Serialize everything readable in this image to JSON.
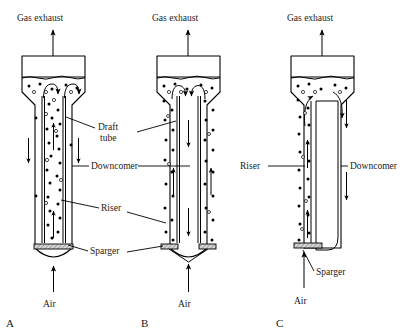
{
  "figure": {
    "panels": [
      {
        "id": "A",
        "letter": "A",
        "type": "internal-loop-draft-tube-riser",
        "gas_outlet_label": "Gas exhaust",
        "air_inlet_label": "Air",
        "riser_location": "inner draft tube (upflow)",
        "downcomer_location": "annulus (downflow)",
        "sparger_count": 1
      },
      {
        "id": "B",
        "letter": "B",
        "type": "internal-loop-draft-tube-downcomer",
        "gas_outlet_label": "Gas exhaust",
        "air_inlet_label": "Air",
        "riser_location": "annulus (upflow)",
        "downcomer_location": "inner draft tube (downflow)",
        "sparger_count": 2
      },
      {
        "id": "C",
        "letter": "C",
        "type": "split-cylinder-external-loop",
        "gas_outlet_label": "Gas exhaust",
        "air_inlet_label": "Air",
        "riser_location": "left channel (upflow, gassed)",
        "downcomer_location": "right channel (downflow, degassed)",
        "sparger_count": 1
      }
    ],
    "labels": {
      "gas_exhaust": "Gas exhaust",
      "air": "Air",
      "draft_tube_line1": "Draft",
      "draft_tube_line2": "tube",
      "downcomer": "Downcomer",
      "riser": "Riser",
      "sparger": "Sparger"
    },
    "colors": {
      "stroke": "#000000",
      "background": "#ffffff",
      "sparger_fill": "#d8d8d8"
    }
  }
}
